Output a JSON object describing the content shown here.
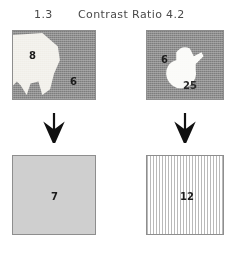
{
  "figure": {
    "header": {
      "left_value": "1.3",
      "title": "Contrast Ratio",
      "right_value": "4.2"
    },
    "plates": {
      "top_left": {
        "name": "low-contrast-camouflage-plate",
        "background_color": "#8d8d8d",
        "shape_color": "#f2f0eb",
        "labels": [
          {
            "text": "8",
            "region": "shape"
          },
          {
            "text": "6",
            "region": "background"
          }
        ]
      },
      "top_right": {
        "name": "high-contrast-camouflage-plate",
        "background_color": "#8d8d8d",
        "shape_color": "#fbfbf8",
        "labels": [
          {
            "text": "6",
            "region": "background"
          },
          {
            "text": "25",
            "region": "shape"
          }
        ]
      },
      "bottom_left": {
        "name": "uniform-gray-plate",
        "background_color": "#cfcfcf",
        "labels": [
          {
            "text": "7",
            "region": "plate"
          }
        ]
      },
      "bottom_right": {
        "name": "vertical-stripe-plate",
        "background_color": "#ffffff",
        "stripe_color": "#b9b9b9",
        "labels": [
          {
            "text": "12",
            "region": "plate"
          }
        ]
      }
    },
    "arrows": {
      "left": {
        "direction": "down"
      },
      "right": {
        "direction": "down"
      }
    }
  }
}
